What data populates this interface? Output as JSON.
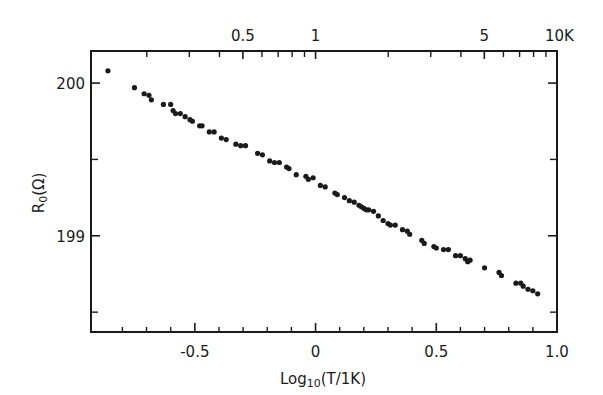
{
  "chart_data": {
    "type": "scatter",
    "title": "",
    "xlabel": "Log10(T/1K)",
    "xlabel_main": "Log",
    "xlabel_sub": "10",
    "xlabel_rest": "(T/1K)",
    "ylabel": "R0(Ω)",
    "ylabel_main": "R",
    "ylabel_sub": "0",
    "ylabel_rest": "(Ω)",
    "xlim": [
      -0.93,
      1.0
    ],
    "ylim": [
      198.37,
      200.21
    ],
    "grid": false,
    "legend": null,
    "x_ticks": [
      {
        "value": -0.5,
        "label": "-0.5"
      },
      {
        "value": 0,
        "label": "0"
      },
      {
        "value": 0.5,
        "label": "0.5"
      },
      {
        "value": 1.0,
        "label": "1.0"
      }
    ],
    "x_minor_ticks": [
      -0.8,
      -0.7,
      -0.6,
      -0.4,
      -0.3,
      -0.2,
      -0.1,
      0.1,
      0.2,
      0.3,
      0.4,
      0.6,
      0.7,
      0.8,
      0.9
    ],
    "y_ticks": [
      {
        "value": 200,
        "label": "200"
      },
      {
        "value": 199,
        "label": "199"
      }
    ],
    "y_minor_ticks": [
      199.5,
      198.5
    ],
    "top_axis": {
      "label_unit": "K",
      "ticks": [
        {
          "value": 0.5,
          "label": "0.5"
        },
        {
          "value": 1,
          "label": "1"
        },
        {
          "value": 5,
          "label": "5"
        },
        {
          "value": 10,
          "label": "10K"
        }
      ],
      "minor_ticks": [
        0.2,
        0.3,
        0.4,
        0.6,
        0.7,
        0.8,
        0.9,
        2,
        3,
        4,
        6,
        7,
        8,
        9
      ]
    },
    "series": [
      {
        "name": "R0 vs log T",
        "points": [
          [
            -0.86,
            200.08
          ],
          [
            -0.75,
            199.97
          ],
          [
            -0.71,
            199.93
          ],
          [
            -0.69,
            199.92
          ],
          [
            -0.68,
            199.89
          ],
          [
            -0.63,
            199.86
          ],
          [
            -0.6,
            199.86
          ],
          [
            -0.59,
            199.82
          ],
          [
            -0.58,
            199.8
          ],
          [
            -0.56,
            199.8
          ],
          [
            -0.54,
            199.78
          ],
          [
            -0.52,
            199.76
          ],
          [
            -0.51,
            199.75
          ],
          [
            -0.48,
            199.72
          ],
          [
            -0.47,
            199.72
          ],
          [
            -0.44,
            199.68
          ],
          [
            -0.42,
            199.68
          ],
          [
            -0.39,
            199.64
          ],
          [
            -0.37,
            199.63
          ],
          [
            -0.33,
            199.6
          ],
          [
            -0.31,
            199.59
          ],
          [
            -0.29,
            199.59
          ],
          [
            -0.24,
            199.54
          ],
          [
            -0.22,
            199.53
          ],
          [
            -0.19,
            199.49
          ],
          [
            -0.17,
            199.48
          ],
          [
            -0.15,
            199.48
          ],
          [
            -0.12,
            199.45
          ],
          [
            -0.11,
            199.44
          ],
          [
            -0.08,
            199.4
          ],
          [
            -0.04,
            199.39
          ],
          [
            -0.03,
            199.37
          ],
          [
            -0.01,
            199.38
          ],
          [
            0.02,
            199.33
          ],
          [
            0.04,
            199.32
          ],
          [
            0.08,
            199.28
          ],
          [
            0.09,
            199.27
          ],
          [
            0.12,
            199.25
          ],
          [
            0.14,
            199.23
          ],
          [
            0.16,
            199.22
          ],
          [
            0.18,
            199.2
          ],
          [
            0.19,
            199.19
          ],
          [
            0.2,
            199.18
          ],
          [
            0.21,
            199.17
          ],
          [
            0.22,
            199.17
          ],
          [
            0.24,
            199.16
          ],
          [
            0.26,
            199.13
          ],
          [
            0.28,
            199.1
          ],
          [
            0.3,
            199.08
          ],
          [
            0.31,
            199.07
          ],
          [
            0.33,
            199.07
          ],
          [
            0.36,
            199.04
          ],
          [
            0.38,
            199.03
          ],
          [
            0.39,
            199.01
          ],
          [
            0.44,
            198.97
          ],
          [
            0.45,
            198.95
          ],
          [
            0.49,
            198.93
          ],
          [
            0.5,
            198.92
          ],
          [
            0.53,
            198.91
          ],
          [
            0.55,
            198.91
          ],
          [
            0.58,
            198.87
          ],
          [
            0.6,
            198.87
          ],
          [
            0.62,
            198.85
          ],
          [
            0.63,
            198.83
          ],
          [
            0.64,
            198.84
          ],
          [
            0.7,
            198.79
          ],
          [
            0.76,
            198.76
          ],
          [
            0.77,
            198.74
          ],
          [
            0.83,
            198.69
          ],
          [
            0.85,
            198.69
          ],
          [
            0.86,
            198.67
          ],
          [
            0.88,
            198.65
          ],
          [
            0.9,
            198.64
          ],
          [
            0.92,
            198.62
          ]
        ]
      }
    ]
  }
}
